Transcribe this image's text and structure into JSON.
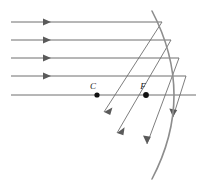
{
  "figure": {
    "width": 205,
    "height": 188,
    "background_color": "#ffffff",
    "ray_color": "#6f6f6f",
    "mirror_color": "#8d8d8d",
    "point_color": "#111111"
  },
  "labels": {
    "center_of_curvature": "C",
    "focal_point": "F"
  },
  "points": [
    {
      "name": "C",
      "label": "C",
      "x": 97,
      "y": 95,
      "label_x": 96,
      "label_y": 88
    },
    {
      "name": "F",
      "label": "F",
      "x": 146,
      "y": 95,
      "label_x": 144,
      "label_y": 88
    }
  ],
  "mirror": {
    "name": "concave-spherical-mirror",
    "path": "M 152 11 Q 196 95 152 179",
    "top_x": 152,
    "top_y": 11,
    "bottom_x": 152,
    "bottom_y": 179,
    "vertex_x": 191,
    "vertex_y": 95
  },
  "incoming_rays": [
    {
      "name": "incoming-ray-1",
      "x1": 11,
      "y1": 22,
      "x2": 162,
      "y2": 22,
      "arrow_x": 47,
      "arrow_y": 22
    },
    {
      "name": "incoming-ray-2",
      "x1": 11,
      "y1": 40,
      "x2": 171,
      "y2": 40,
      "arrow_x": 47,
      "arrow_y": 40
    },
    {
      "name": "incoming-ray-3",
      "x1": 11,
      "y1": 58,
      "x2": 179,
      "y2": 58,
      "arrow_x": 47,
      "arrow_y": 58
    },
    {
      "name": "incoming-ray-4",
      "x1": 11,
      "y1": 76,
      "x2": 186,
      "y2": 76,
      "arrow_x": 47,
      "arrow_y": 76
    }
  ],
  "optical_axis": {
    "name": "optical-axis",
    "x1": 11,
    "y1": 95,
    "x2": 196,
    "y2": 95
  },
  "reflected_rays": [
    {
      "name": "reflected-ray-1",
      "x1": 162,
      "y1": 22,
      "x2": 104,
      "y2": 112,
      "arrow_x": 104,
      "arrow_y": 112,
      "angle": 122
    },
    {
      "name": "reflected-ray-2",
      "x1": 171,
      "y1": 40,
      "x2": 117,
      "y2": 133,
      "arrow_x": 117,
      "arrow_y": 133,
      "angle": 120
    },
    {
      "name": "reflected-ray-3",
      "x1": 179,
      "y1": 58,
      "x2": 147,
      "y2": 144,
      "arrow_x": 147,
      "arrow_y": 144,
      "angle": 110
    },
    {
      "name": "reflected-ray-4",
      "x1": 186,
      "y1": 76,
      "x2": 173,
      "y2": 117,
      "arrow_x": 173,
      "arrow_y": 117,
      "angle": 108
    }
  ]
}
